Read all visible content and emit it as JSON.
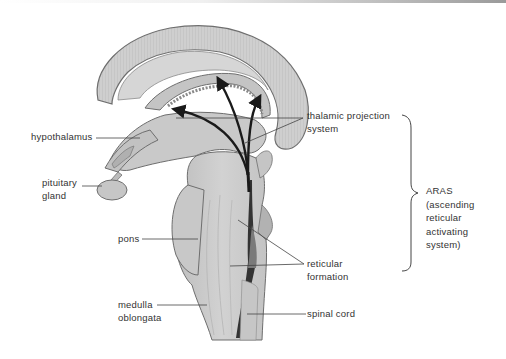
{
  "diagram": {
    "labels": {
      "hypothalamus": "hypothalamus",
      "pituitary_line1": "pituitary",
      "pituitary_line2": "gland",
      "pons": "pons",
      "medulla_line1": "medulla",
      "medulla_line2": "oblongata",
      "thalamic_line1": "thalamic projection",
      "thalamic_line2": "system",
      "reticular_line1": "reticular",
      "reticular_line2": "formation",
      "spinal_cord": "spinal cord",
      "aras_line1": "ARAS",
      "aras_line2": "(ascending",
      "aras_line3": "reticular",
      "aras_line4": "activating",
      "aras_line5": "system)"
    },
    "colors": {
      "tissue_fill": "#c9c9c9",
      "tissue_dark": "#a8a8a8",
      "outline": "#6e6e6e",
      "arrow": "#1a1a1a",
      "text": "#333333"
    }
  }
}
